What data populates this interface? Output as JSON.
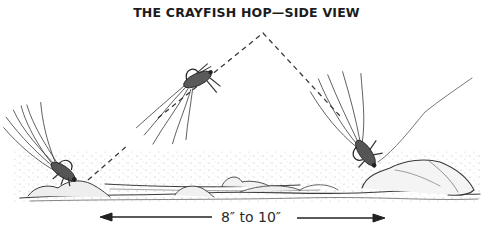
{
  "title": "THE CRAYFISH HOP—SIDE VIEW",
  "illustration": {
    "subject": "crayfish fly hopping along the stream bottom",
    "fly_positions": [
      "start-on-bottom",
      "mid-hop",
      "landing-on-rock"
    ],
    "path": "dashed arc",
    "ground": "gravel and rocks"
  },
  "measurement": {
    "label": "8″ to 10″",
    "arrow_left": "left-arrow",
    "arrow_right": "right-arrow"
  },
  "colors": {
    "ink": "#2a2a2a",
    "background": "#ffffff"
  }
}
